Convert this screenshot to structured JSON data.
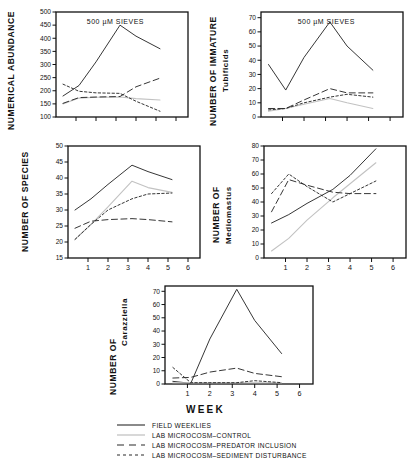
{
  "figure": {
    "xlabel": "WEEK",
    "panel_annotation": "500 µM SIEVES"
  },
  "legend": {
    "items": [
      {
        "label": "FIELD WEEKLIES",
        "style": "solid",
        "color": "#2b2b2b"
      },
      {
        "label": "LAB MICROCOSM–CONTROL",
        "style": "light-solid",
        "color": "#b9b9b9"
      },
      {
        "label": "LAB MICROCOSM–PREDATOR INCLUSION",
        "style": "long-dash",
        "color": "#2b2b2b"
      },
      {
        "label": "LAB MICROCOSM–SEDIMENT DISTURBANCE",
        "style": "short-dash",
        "color": "#2b2b2b"
      }
    ]
  },
  "chart_data": [
    {
      "type": "line",
      "id": "numerical-abundance",
      "title": "500 µM SIEVES",
      "ylabel": "NUMERICAL ABUNDANCE",
      "xlabel": "",
      "x": [
        0.35,
        1.15,
        2,
        3.2,
        4,
        5.2
      ],
      "xlim": [
        0,
        6.6
      ],
      "ylim": [
        100,
        500
      ],
      "yticks": [
        100,
        150,
        200,
        250,
        300,
        350,
        400,
        450,
        500
      ],
      "xticks": [
        1,
        2,
        3,
        4,
        5,
        6
      ],
      "xticklabels": [
        "",
        "",
        "",
        "",
        "",
        ""
      ],
      "grid": false,
      "series": [
        {
          "name": "FIELD WEEKLIES",
          "style": "solid",
          "values": [
            180,
            220,
            310,
            450,
            408,
            360
          ]
        },
        {
          "name": "LAB MICROCOSM–CONTROL",
          "style": "light-solid",
          "values": [
            150,
            172,
            175,
            176,
            170,
            165
          ]
        },
        {
          "name": "LAB MICROCOSM–PREDATOR INCLUSION",
          "style": "long-dash",
          "values": [
            152,
            174,
            176,
            178,
            215,
            248
          ]
        },
        {
          "name": "LAB MICROCOSM–SEDIMENT DISTURBANCE",
          "style": "short-dash",
          "values": [
            225,
            198,
            192,
            190,
            160,
            122
          ]
        }
      ]
    },
    {
      "type": "line",
      "id": "immature-tubificids",
      "title": "500 µM SIEVES",
      "ylabel_line1": "NUMBER OF IMMATURE",
      "ylabel_line2": "Tubificids",
      "xlabel": "",
      "x": [
        0.35,
        1.15,
        2,
        3.2,
        4,
        5.2
      ],
      "xlim": [
        0,
        6.6
      ],
      "ylim": [
        0,
        74
      ],
      "yticks": [
        0,
        10,
        20,
        30,
        40,
        50,
        60,
        70
      ],
      "xticks": [
        1,
        2,
        3,
        4,
        5,
        6
      ],
      "xticklabels": [
        "",
        "",
        "",
        "",
        "",
        ""
      ],
      "grid": false,
      "series": [
        {
          "name": "FIELD WEEKLIES",
          "style": "solid",
          "values": [
            37,
            19,
            42,
            67,
            50,
            33
          ]
        },
        {
          "name": "LAB MICROCOSM–CONTROL",
          "style": "light-solid",
          "values": [
            4,
            6,
            9,
            13,
            10,
            6
          ]
        },
        {
          "name": "LAB MICROCOSM–PREDATOR INCLUSION",
          "style": "long-dash",
          "values": [
            6,
            6,
            12,
            20,
            17,
            17
          ]
        },
        {
          "name": "LAB MICROCOSM–SEDIMENT DISTURBANCE",
          "style": "short-dash",
          "values": [
            5,
            6,
            10,
            14,
            16,
            14
          ]
        }
      ]
    },
    {
      "type": "line",
      "id": "number-of-species",
      "title": "",
      "ylabel": "NUMBER OF SPECIES",
      "xlabel": "",
      "x": [
        0.35,
        1.15,
        2,
        3.2,
        4,
        5.2
      ],
      "xlim": [
        0,
        6.6
      ],
      "ylim": [
        15,
        50
      ],
      "yticks": [
        15,
        20,
        25,
        30,
        35,
        40,
        45,
        50
      ],
      "xticks": [
        1,
        2,
        3,
        4,
        5,
        6
      ],
      "xticklabels": [
        "1",
        "2",
        "3",
        "4",
        "5",
        "6"
      ],
      "grid": false,
      "series": [
        {
          "name": "FIELD WEEKLIES",
          "style": "solid",
          "values": [
            30,
            33.5,
            38,
            44,
            42,
            39.5
          ]
        },
        {
          "name": "LAB MICROCOSM–CONTROL",
          "style": "light-solid",
          "values": [
            20.8,
            25.5,
            31,
            39,
            37,
            35.5
          ]
        },
        {
          "name": "LAB MICROCOSM–PREDATOR INCLUSION",
          "style": "long-dash",
          "values": [
            24.3,
            26.5,
            27,
            27.3,
            27,
            26.3
          ]
        },
        {
          "name": "LAB MICROCOSM–SEDIMENT DISTURBANCE",
          "style": "short-dash",
          "values": [
            20.8,
            25.5,
            30,
            33.5,
            35,
            35.3
          ]
        }
      ]
    },
    {
      "type": "line",
      "id": "mediomastus",
      "title": "",
      "ylabel_line1": "NUMBER OF",
      "ylabel_line2": "Mediomastus",
      "xlabel": "",
      "x": [
        0.35,
        1.15,
        2,
        3.2,
        4,
        5.2
      ],
      "xlim": [
        0,
        6.6
      ],
      "ylim": [
        0,
        80
      ],
      "yticks": [
        0,
        10,
        20,
        30,
        40,
        50,
        60,
        70,
        80
      ],
      "xticks": [
        1,
        2,
        3,
        4,
        5,
        6
      ],
      "xticklabels": [
        "1",
        "2",
        "3",
        "4",
        "5",
        "6"
      ],
      "grid": false,
      "series": [
        {
          "name": "FIELD WEEKLIES",
          "style": "solid",
          "values": [
            25,
            31,
            39,
            49,
            59,
            78
          ]
        },
        {
          "name": "LAB MICROCOSM–CONTROL",
          "style": "light-solid",
          "values": [
            5,
            14,
            27,
            43,
            53,
            68
          ]
        },
        {
          "name": "LAB MICROCOSM–PREDATOR INCLUSION",
          "style": "long-dash",
          "values": [
            33,
            56,
            52,
            47,
            46,
            46
          ]
        },
        {
          "name": "LAB MICROCOSM–SEDIMENT DISTURBANCE",
          "style": "short-dash",
          "values": [
            46,
            60,
            51,
            40,
            46,
            55
          ]
        }
      ]
    },
    {
      "type": "line",
      "id": "carazziella",
      "title": "",
      "ylabel_line1": "NUMBER OF",
      "ylabel_line2": "Carazziella",
      "xlabel": "WEEK",
      "x": [
        0.35,
        1.15,
        2,
        3.2,
        4,
        5.2
      ],
      "xlim": [
        0,
        6.6
      ],
      "ylim": [
        0,
        74
      ],
      "yticks": [
        0,
        10,
        20,
        30,
        40,
        50,
        60,
        70
      ],
      "xticks": [
        1,
        2,
        3,
        4,
        5,
        6
      ],
      "xticklabels": [
        "1",
        "2",
        "3",
        "4",
        "5",
        "6"
      ],
      "grid": false,
      "series": [
        {
          "name": "FIELD WEEKLIES",
          "style": "solid",
          "values": [
            2,
            0.5,
            34,
            71.5,
            48,
            23
          ]
        },
        {
          "name": "LAB MICROCOSM–CONTROL",
          "style": "light-solid",
          "values": [
            1,
            1,
            1,
            1,
            1,
            1
          ]
        },
        {
          "name": "LAB MICROCOSM–PREDATOR INCLUSION",
          "style": "long-dash",
          "values": [
            4.5,
            5,
            9,
            12,
            8,
            5.5
          ]
        },
        {
          "name": "LAB MICROCOSM–SEDIMENT DISTURBANCE",
          "style": "short-dash",
          "values": [
            12.5,
            1,
            1,
            1,
            2.5,
            1
          ]
        }
      ]
    }
  ]
}
